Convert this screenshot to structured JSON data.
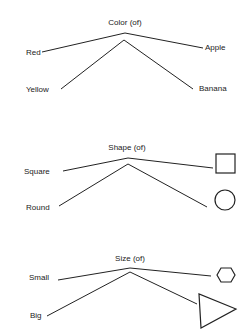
{
  "diagrams": [
    {
      "title": "Color (of)",
      "left_top": "Red",
      "left_bottom": "Yellow",
      "right_top": "Apple",
      "right_bottom": "Banana"
    },
    {
      "title": "Shape (of)",
      "left_top": "Square",
      "left_bottom": "Round",
      "right_top": "square-shape",
      "right_bottom": "circle-shape"
    },
    {
      "title": "Size (of)",
      "left_top": "Small",
      "left_bottom": "Big",
      "right_top": "small-hexagon-shape",
      "right_bottom": "big-triangle-shape"
    }
  ],
  "colors": {
    "line": "#222222",
    "background": "#ffffff"
  }
}
